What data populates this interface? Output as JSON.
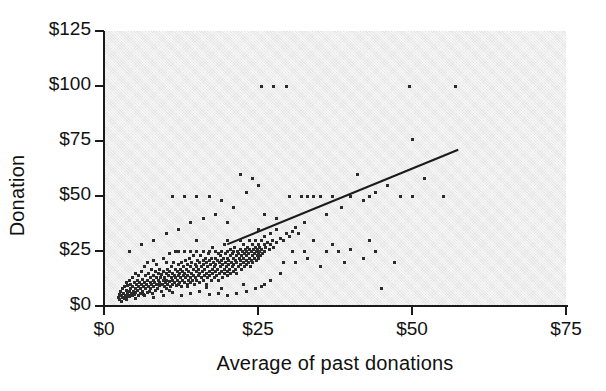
{
  "chart_data": {
    "type": "scatter",
    "title": "",
    "xlabel": "Average of past donations",
    "ylabel": "Donation",
    "xlim": [
      0,
      75
    ],
    "ylim": [
      0,
      125
    ],
    "xticks": [
      0,
      25,
      50,
      75
    ],
    "yticks": [
      0,
      25,
      50,
      75,
      100,
      125
    ],
    "xtick_labels": [
      "$0",
      "$25",
      "$50",
      "$75"
    ],
    "ytick_labels": [
      "$0",
      "$25",
      "$50",
      "$75",
      "$100",
      "$125"
    ],
    "grid": false,
    "legend": null,
    "plot_background_color": "#e4e4e4",
    "marker_color": "#2b2b2b",
    "trendline_color": "#1a1a1a",
    "trendline": {
      "type": "linear-fit",
      "x_start": 20.0,
      "y_start": 28.0,
      "x_end": 57.5,
      "y_end": 71.0
    },
    "points": [
      [
        2.2,
        4.0
      ],
      [
        2.4,
        5.5
      ],
      [
        2.5,
        3.0
      ],
      [
        2.6,
        7.0
      ],
      [
        2.8,
        5.0
      ],
      [
        3.0,
        4.0
      ],
      [
        3.0,
        8.0
      ],
      [
        3.1,
        6.0
      ],
      [
        3.2,
        3.5
      ],
      [
        3.3,
        9.0
      ],
      [
        3.4,
        5.0
      ],
      [
        3.5,
        7.5
      ],
      [
        3.5,
        11.0
      ],
      [
        3.6,
        4.0
      ],
      [
        3.7,
        6.5
      ],
      [
        3.8,
        9.5
      ],
      [
        3.9,
        5.0
      ],
      [
        4.0,
        7.0
      ],
      [
        4.0,
        12.0
      ],
      [
        4.1,
        4.5
      ],
      [
        4.2,
        8.0
      ],
      [
        4.3,
        10.0
      ],
      [
        4.4,
        6.0
      ],
      [
        4.5,
        5.0
      ],
      [
        4.5,
        13.0
      ],
      [
        4.6,
        9.0
      ],
      [
        4.7,
        7.0
      ],
      [
        4.8,
        11.0
      ],
      [
        4.9,
        5.5
      ],
      [
        5.0,
        8.0
      ],
      [
        5.0,
        15.0
      ],
      [
        5.1,
        6.5
      ],
      [
        5.2,
        10.0
      ],
      [
        5.3,
        12.0
      ],
      [
        5.4,
        7.5
      ],
      [
        5.5,
        5.0
      ],
      [
        5.5,
        9.0
      ],
      [
        5.6,
        14.0
      ],
      [
        5.7,
        11.0
      ],
      [
        5.8,
        8.0
      ],
      [
        5.9,
        6.0
      ],
      [
        6.0,
        10.0
      ],
      [
        6.0,
        16.0
      ],
      [
        6.1,
        7.0
      ],
      [
        6.2,
        12.5
      ],
      [
        6.3,
        9.0
      ],
      [
        6.4,
        5.5
      ],
      [
        6.5,
        11.0
      ],
      [
        6.5,
        18.0
      ],
      [
        6.6,
        8.0
      ],
      [
        6.7,
        14.0
      ],
      [
        6.8,
        10.0
      ],
      [
        6.9,
        6.5
      ],
      [
        7.0,
        12.0
      ],
      [
        7.0,
        20.0
      ],
      [
        7.1,
        9.0
      ],
      [
        7.2,
        15.0
      ],
      [
        7.3,
        7.0
      ],
      [
        7.4,
        11.0
      ],
      [
        7.5,
        13.0
      ],
      [
        7.5,
        8.0
      ],
      [
        7.6,
        17.0
      ],
      [
        7.7,
        10.0
      ],
      [
        7.8,
        6.0
      ],
      [
        7.9,
        12.0
      ],
      [
        8.0,
        9.0
      ],
      [
        8.0,
        14.0
      ],
      [
        8.0,
        21.0
      ],
      [
        8.1,
        11.0
      ],
      [
        8.2,
        7.5
      ],
      [
        8.3,
        16.0
      ],
      [
        8.4,
        10.0
      ],
      [
        8.5,
        13.0
      ],
      [
        8.5,
        19.0
      ],
      [
        8.6,
        8.0
      ],
      [
        8.7,
        12.0
      ],
      [
        8.8,
        15.0
      ],
      [
        8.9,
        9.5
      ],
      [
        9.0,
        11.0
      ],
      [
        9.0,
        17.0
      ],
      [
        9.1,
        13.0
      ],
      [
        9.2,
        7.0
      ],
      [
        9.3,
        14.5
      ],
      [
        9.4,
        10.0
      ],
      [
        9.5,
        12.0
      ],
      [
        9.5,
        22.0
      ],
      [
        9.6,
        16.0
      ],
      [
        9.7,
        9.0
      ],
      [
        9.8,
        13.0
      ],
      [
        9.9,
        11.0
      ],
      [
        10.0,
        8.0
      ],
      [
        10.0,
        15.0
      ],
      [
        10.0,
        20.0
      ],
      [
        10.1,
        12.0
      ],
      [
        10.2,
        17.0
      ],
      [
        10.3,
        10.0
      ],
      [
        10.4,
        14.0
      ],
      [
        10.5,
        11.5
      ],
      [
        10.5,
        24.0
      ],
      [
        10.6,
        16.0
      ],
      [
        10.7,
        9.0
      ],
      [
        10.8,
        13.0
      ],
      [
        10.9,
        18.0
      ],
      [
        11.0,
        12.0
      ],
      [
        11.0,
        15.0
      ],
      [
        11.1,
        10.0
      ],
      [
        11.2,
        20.0
      ],
      [
        11.3,
        14.0
      ],
      [
        11.4,
        11.0
      ],
      [
        11.5,
        17.0
      ],
      [
        11.5,
        25.0
      ],
      [
        11.6,
        13.0
      ],
      [
        11.7,
        9.5
      ],
      [
        11.8,
        16.0
      ],
      [
        11.9,
        12.0
      ],
      [
        12.0,
        10.0
      ],
      [
        12.0,
        14.0
      ],
      [
        12.0,
        19.0
      ],
      [
        12.0,
        25.0
      ],
      [
        12.1,
        15.0
      ],
      [
        12.2,
        11.0
      ],
      [
        12.3,
        17.0
      ],
      [
        12.4,
        13.0
      ],
      [
        12.5,
        20.0
      ],
      [
        12.5,
        9.0
      ],
      [
        12.6,
        16.0
      ],
      [
        12.7,
        12.0
      ],
      [
        12.8,
        18.0
      ],
      [
        12.9,
        14.0
      ],
      [
        13.0,
        11.0
      ],
      [
        13.0,
        15.0
      ],
      [
        13.0,
        25.0
      ],
      [
        13.1,
        21.0
      ],
      [
        13.2,
        13.0
      ],
      [
        13.3,
        17.0
      ],
      [
        13.4,
        10.0
      ],
      [
        13.5,
        19.0
      ],
      [
        13.5,
        14.0
      ],
      [
        13.6,
        12.0
      ],
      [
        13.7,
        16.0
      ],
      [
        13.8,
        22.0
      ],
      [
        13.9,
        13.0
      ],
      [
        14.0,
        11.0
      ],
      [
        14.0,
        18.0
      ],
      [
        14.0,
        25.0
      ],
      [
        14.1,
        15.0
      ],
      [
        14.2,
        20.0
      ],
      [
        14.3,
        12.0
      ],
      [
        14.4,
        17.0
      ],
      [
        14.5,
        14.0
      ],
      [
        14.5,
        23.0
      ],
      [
        14.6,
        10.0
      ],
      [
        14.7,
        19.0
      ],
      [
        14.8,
        13.0
      ],
      [
        14.9,
        16.0
      ],
      [
        15.0,
        12.0
      ],
      [
        15.0,
        18.0
      ],
      [
        15.0,
        25.0
      ],
      [
        15.0,
        30.0
      ],
      [
        15.1,
        21.0
      ],
      [
        15.2,
        14.0
      ],
      [
        15.3,
        17.0
      ],
      [
        15.4,
        11.0
      ],
      [
        15.5,
        20.0
      ],
      [
        15.5,
        15.0
      ],
      [
        15.6,
        23.0
      ],
      [
        15.7,
        13.0
      ],
      [
        15.8,
        18.0
      ],
      [
        15.9,
        16.0
      ],
      [
        16.0,
        12.0
      ],
      [
        16.0,
        21.0
      ],
      [
        16.0,
        25.0
      ],
      [
        16.1,
        19.0
      ],
      [
        16.2,
        14.0
      ],
      [
        16.3,
        17.0
      ],
      [
        16.4,
        22.0
      ],
      [
        16.5,
        15.0
      ],
      [
        16.5,
        10.0
      ],
      [
        16.6,
        20.0
      ],
      [
        16.7,
        18.0
      ],
      [
        16.8,
        13.0
      ],
      [
        16.9,
        24.0
      ],
      [
        17.0,
        16.0
      ],
      [
        17.0,
        21.0
      ],
      [
        17.0,
        25.0
      ],
      [
        17.1,
        14.0
      ],
      [
        17.2,
        19.0
      ],
      [
        17.3,
        12.0
      ],
      [
        17.4,
        22.0
      ],
      [
        17.5,
        17.0
      ],
      [
        17.5,
        27.0
      ],
      [
        17.6,
        15.0
      ],
      [
        17.7,
        20.0
      ],
      [
        17.8,
        18.0
      ],
      [
        17.9,
        13.0
      ],
      [
        18.0,
        16.0
      ],
      [
        18.0,
        22.0
      ],
      [
        18.0,
        25.0
      ],
      [
        18.1,
        19.0
      ],
      [
        18.2,
        14.0
      ],
      [
        18.3,
        21.0
      ],
      [
        18.4,
        17.0
      ],
      [
        18.5,
        24.0
      ],
      [
        18.5,
        12.0
      ],
      [
        18.6,
        20.0
      ],
      [
        18.7,
        15.0
      ],
      [
        18.8,
        23.0
      ],
      [
        18.9,
        18.0
      ],
      [
        19.0,
        16.0
      ],
      [
        19.0,
        25.0
      ],
      [
        19.0,
        21.0
      ],
      [
        19.1,
        13.0
      ],
      [
        19.2,
        19.0
      ],
      [
        19.3,
        22.0
      ],
      [
        19.4,
        17.0
      ],
      [
        19.5,
        15.0
      ],
      [
        19.5,
        28.0
      ],
      [
        19.6,
        20.0
      ],
      [
        19.7,
        24.0
      ],
      [
        19.8,
        18.0
      ],
      [
        19.9,
        14.0
      ],
      [
        20.0,
        16.0
      ],
      [
        20.0,
        22.0
      ],
      [
        20.0,
        25.0
      ],
      [
        20.0,
        30.0
      ],
      [
        20.1,
        19.0
      ],
      [
        20.2,
        21.0
      ],
      [
        20.3,
        17.0
      ],
      [
        20.4,
        23.0
      ],
      [
        20.5,
        15.0
      ],
      [
        20.5,
        26.0
      ],
      [
        20.6,
        20.0
      ],
      [
        20.7,
        18.0
      ],
      [
        20.8,
        24.0
      ],
      [
        20.9,
        16.0
      ],
      [
        21.0,
        22.0
      ],
      [
        21.0,
        25.0
      ],
      [
        21.0,
        19.0
      ],
      [
        21.1,
        27.0
      ],
      [
        21.2,
        17.0
      ],
      [
        21.3,
        21.0
      ],
      [
        21.4,
        23.0
      ],
      [
        21.5,
        20.0
      ],
      [
        21.5,
        15.0
      ],
      [
        21.6,
        25.0
      ],
      [
        21.7,
        18.0
      ],
      [
        21.8,
        24.0
      ],
      [
        21.9,
        22.0
      ],
      [
        22.0,
        19.0
      ],
      [
        22.0,
        26.0
      ],
      [
        22.0,
        30.0
      ],
      [
        22.1,
        21.0
      ],
      [
        22.2,
        17.0
      ],
      [
        22.3,
        23.0
      ],
      [
        22.4,
        25.0
      ],
      [
        22.5,
        20.0
      ],
      [
        22.5,
        28.0
      ],
      [
        22.6,
        22.0
      ],
      [
        22.7,
        18.0
      ],
      [
        22.8,
        24.0
      ],
      [
        22.9,
        26.0
      ],
      [
        23.0,
        21.0
      ],
      [
        23.0,
        25.0
      ],
      [
        23.0,
        19.0
      ],
      [
        23.1,
        23.0
      ],
      [
        23.2,
        27.0
      ],
      [
        23.3,
        20.0
      ],
      [
        23.4,
        24.0
      ],
      [
        23.5,
        22.0
      ],
      [
        23.5,
        30.0
      ],
      [
        23.6,
        26.0
      ],
      [
        23.7,
        18.0
      ],
      [
        23.8,
        25.0
      ],
      [
        23.9,
        21.0
      ],
      [
        24.0,
        23.0
      ],
      [
        24.0,
        28.0
      ],
      [
        24.1,
        20.0
      ],
      [
        24.2,
        26.0
      ],
      [
        24.3,
        24.0
      ],
      [
        24.4,
        22.0
      ],
      [
        24.5,
        27.0
      ],
      [
        24.5,
        30.0
      ],
      [
        24.6,
        25.0
      ],
      [
        24.7,
        21.0
      ],
      [
        24.8,
        23.0
      ],
      [
        24.9,
        26.0
      ],
      [
        25.0,
        24.0
      ],
      [
        25.0,
        28.0
      ],
      [
        25.0,
        22.0
      ],
      [
        25.0,
        35.0
      ],
      [
        25.1,
        25.0
      ],
      [
        25.2,
        27.0
      ],
      [
        25.3,
        23.0
      ],
      [
        25.5,
        26.0
      ],
      [
        25.5,
        30.0
      ],
      [
        25.7,
        24.0
      ],
      [
        25.9,
        28.0
      ],
      [
        26.0,
        25.0
      ],
      [
        26.0,
        32.0
      ],
      [
        26.2,
        27.0
      ],
      [
        26.5,
        29.0
      ],
      [
        26.8,
        26.0
      ],
      [
        27.0,
        28.0
      ],
      [
        27.0,
        33.0
      ],
      [
        27.3,
        30.0
      ],
      [
        27.5,
        27.0
      ],
      [
        28.0,
        29.0
      ],
      [
        28.0,
        35.0
      ],
      [
        28.5,
        31.0
      ],
      [
        29.0,
        30.0
      ],
      [
        29.5,
        33.0
      ],
      [
        30.0,
        32.0
      ],
      [
        30.0,
        50.0
      ],
      [
        30.5,
        34.0
      ],
      [
        31.0,
        36.0
      ],
      [
        31.5,
        33.0
      ],
      [
        32.0,
        50.0
      ],
      [
        32.5,
        38.0
      ],
      [
        33.0,
        50.0
      ],
      [
        34.0,
        50.0
      ],
      [
        35.0,
        50.0
      ],
      [
        36.0,
        42.0
      ],
      [
        37.0,
        50.0
      ],
      [
        38.0,
        25.0
      ],
      [
        38.5,
        45.0
      ],
      [
        40.0,
        50.0
      ],
      [
        41.0,
        60.0
      ],
      [
        42.0,
        48.0
      ],
      [
        43.0,
        50.0
      ],
      [
        44.0,
        52.0
      ],
      [
        45.0,
        8.0
      ],
      [
        46.0,
        55.0
      ],
      [
        48.0,
        50.0
      ],
      [
        50.0,
        76.0
      ],
      [
        50.0,
        50.0
      ],
      [
        52.0,
        58.0
      ],
      [
        55.0,
        50.0
      ],
      [
        57.0,
        100.0
      ],
      [
        25.5,
        100.0
      ],
      [
        27.5,
        100.0
      ],
      [
        29.5,
        100.0
      ],
      [
        49.5,
        100.0
      ],
      [
        22.0,
        60.0
      ],
      [
        24.0,
        58.0
      ],
      [
        16.0,
        40.0
      ],
      [
        18.0,
        42.0
      ],
      [
        20.0,
        38.0
      ],
      [
        12.0,
        35.0
      ],
      [
        14.0,
        38.0
      ],
      [
        10.0,
        33.0
      ],
      [
        8.0,
        30.0
      ],
      [
        6.0,
        28.0
      ],
      [
        4.0,
        25.0
      ],
      [
        26.0,
        42.0
      ],
      [
        28.0,
        40.0
      ],
      [
        21.0,
        45.0
      ],
      [
        19.0,
        48.0
      ],
      [
        23.0,
        52.0
      ],
      [
        25.0,
        55.0
      ],
      [
        17.0,
        50.0
      ],
      [
        15.0,
        50.0
      ],
      [
        13.0,
        50.0
      ],
      [
        11.0,
        50.0
      ],
      [
        31.0,
        20.0
      ],
      [
        33.0,
        22.0
      ],
      [
        35.0,
        18.0
      ],
      [
        36.0,
        25.0
      ],
      [
        39.0,
        20.0
      ],
      [
        42.0,
        22.0
      ],
      [
        44.0,
        25.0
      ],
      [
        47.0,
        20.0
      ],
      [
        34.0,
        30.0
      ],
      [
        37.0,
        28.0
      ],
      [
        40.0,
        26.0
      ],
      [
        43.0,
        30.0
      ],
      [
        30.5,
        25.0
      ],
      [
        32.5,
        25.0
      ],
      [
        29.0,
        20.0
      ],
      [
        28.5,
        15.0
      ],
      [
        27.0,
        12.0
      ],
      [
        26.0,
        10.0
      ],
      [
        24.5,
        8.0
      ],
      [
        23.0,
        7.0
      ],
      [
        21.5,
        6.0
      ],
      [
        20.0,
        5.0
      ],
      [
        18.5,
        6.0
      ],
      [
        17.0,
        5.5
      ],
      [
        15.5,
        7.0
      ],
      [
        14.0,
        6.0
      ],
      [
        12.5,
        5.0
      ],
      [
        11.0,
        6.5
      ],
      [
        9.5,
        5.0
      ],
      [
        8.0,
        4.0
      ],
      [
        6.5,
        5.0
      ],
      [
        5.0,
        3.5
      ],
      [
        3.5,
        3.0
      ],
      [
        2.8,
        2.5
      ],
      [
        19.0,
        8.0
      ],
      [
        22.5,
        10.0
      ],
      [
        25.5,
        9.0
      ],
      [
        16.5,
        8.5
      ],
      [
        13.5,
        9.0
      ],
      [
        10.5,
        7.5
      ]
    ]
  }
}
